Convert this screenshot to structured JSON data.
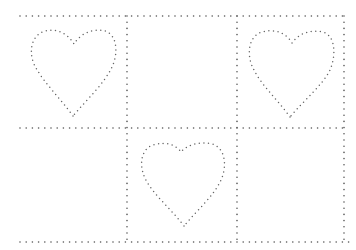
{
  "worksheet": {
    "title": "Dotted heart tracing grid",
    "colors": {
      "background": "#ffffff",
      "dots": "#555555",
      "heart_dots": "#666666"
    },
    "grid": {
      "rows": 2,
      "cols": 3,
      "x_lines": [
        127,
        237,
        344
      ],
      "y_lines": [
        16,
        128,
        242
      ],
      "x_start": 20
    },
    "cells": [
      {
        "row": 0,
        "col": 0,
        "content": "heart-outline"
      },
      {
        "row": 0,
        "col": 1,
        "content": "empty"
      },
      {
        "row": 0,
        "col": 2,
        "content": "heart-outline"
      },
      {
        "row": 1,
        "col": 0,
        "content": "empty"
      },
      {
        "row": 1,
        "col": 1,
        "content": "heart-outline"
      },
      {
        "row": 1,
        "col": 2,
        "content": "empty"
      }
    ]
  }
}
